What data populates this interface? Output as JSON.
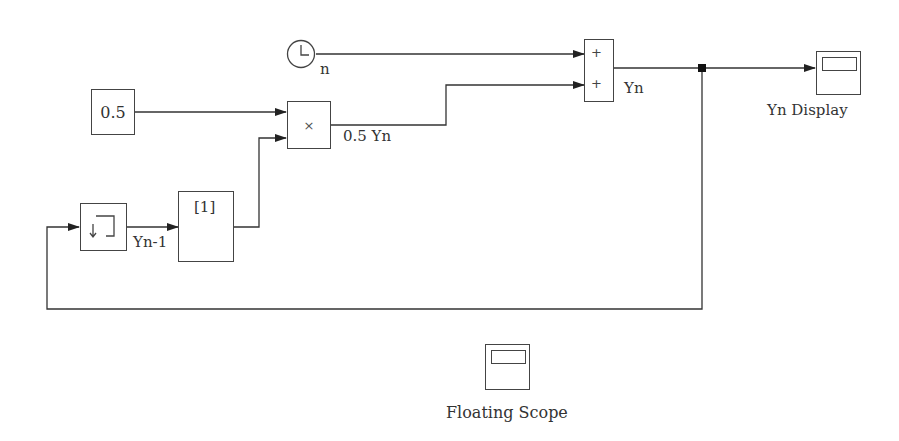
{
  "diagram": {
    "type": "simulink-block-diagram",
    "blocks": {
      "clock": {
        "icon": "clock-icon",
        "label": "n"
      },
      "constant": {
        "value": "0.5"
      },
      "product": {
        "symbol": "×",
        "output_label": "0.5 Yn"
      },
      "sum": {
        "signs": [
          "+",
          "+"
        ],
        "output_label": "Yn"
      },
      "memory": {
        "icon": "memory-icon",
        "output_label": "Yn-1"
      },
      "selector": {
        "label": "[1]"
      },
      "scope_display": {
        "icon": "scope-icon",
        "label": "Yn Display"
      },
      "floating_scope": {
        "icon": "scope-icon",
        "label": "Floating Scope"
      }
    },
    "connections": [
      {
        "from": "clock",
        "to": "sum.in1",
        "label": "n"
      },
      {
        "from": "constant",
        "to": "product.in1"
      },
      {
        "from": "selector",
        "to": "product.in2"
      },
      {
        "from": "product",
        "to": "sum.in2",
        "label": "0.5 Yn"
      },
      {
        "from": "sum",
        "to": "scope_display",
        "label": "Yn"
      },
      {
        "from": "sum",
        "to": "memory",
        "note": "feedback via branch point"
      },
      {
        "from": "memory",
        "to": "selector",
        "label": "Yn-1"
      }
    ]
  }
}
